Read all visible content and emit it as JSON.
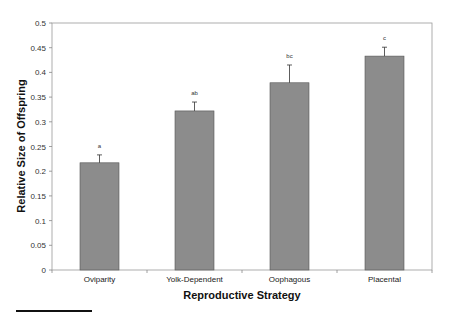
{
  "chart_data": {
    "type": "bar",
    "title": "",
    "xlabel": "Reproductive Strategy",
    "ylabel": "Relative Size of Offspring",
    "categories": [
      "Oviparity",
      "Yolk-Dependent",
      "Oophagous",
      "Placental"
    ],
    "values": [
      0.217,
      0.322,
      0.379,
      0.433
    ],
    "error_upper": [
      0.016,
      0.018,
      0.036,
      0.018
    ],
    "significance_labels": [
      "a",
      "ab",
      "bc",
      "c"
    ],
    "ylim": [
      0,
      0.5
    ],
    "yticks": [
      0,
      0.05,
      0.1,
      0.15,
      0.2,
      0.25,
      0.3,
      0.35,
      0.4,
      0.45,
      0.5
    ],
    "grid": false,
    "legend": null,
    "bar_color": "#8c8c8c"
  }
}
